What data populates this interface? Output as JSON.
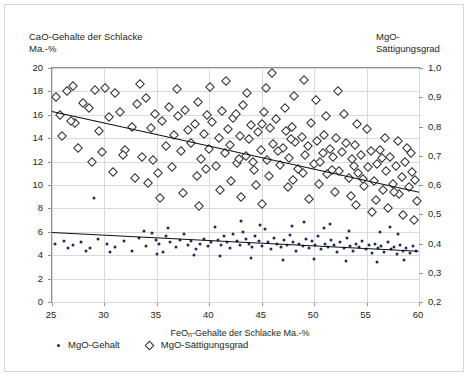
{
  "chart_data": {
    "type": "scatter",
    "title": "",
    "xlabel": "FeOn-Gehalte der Schlacke Ma.-%",
    "ylabel_left": "CaO-Gehalte der Schlacke\nMa.-%",
    "ylabel_right": "MgO-Sättigungsgrad",
    "xlim": [
      25,
      60
    ],
    "ylim_left": [
      0,
      20
    ],
    "ylim_right": [
      0.2,
      1.0
    ],
    "xticks": [
      "25",
      "30",
      "35",
      "40",
      "45",
      "50",
      "55",
      "60"
    ],
    "xtick_values": [
      25,
      30,
      35,
      40,
      45,
      50,
      55,
      60
    ],
    "yticks_left": [
      "0",
      "2",
      "4",
      "6",
      "8",
      "10",
      "12",
      "14",
      "16",
      "18",
      "20"
    ],
    "ytick_values_left": [
      0,
      2,
      4,
      6,
      8,
      10,
      12,
      14,
      16,
      18,
      20
    ],
    "yticks_right": [
      "0,2",
      "0,3",
      "0,4",
      "0,5",
      "0,6",
      "0,7",
      "0,8",
      "0,9",
      "1,0"
    ],
    "ytick_values_right": [
      0.2,
      0.3,
      0.4,
      0.5,
      0.6,
      0.7,
      0.8,
      0.9,
      1.0
    ],
    "grid": true,
    "legend_position": "below",
    "legend": [
      {
        "label": "MgO-Gehalt",
        "marker": "filled-circle",
        "color": "#1c2a60"
      },
      {
        "label": "MgO-Sättigungsgrad",
        "marker": "open-diamond",
        "color": "#2b2b2b"
      }
    ],
    "series": [
      {
        "name": "MgO-Gehalt",
        "marker": "filled-circle",
        "color": "#1c2a60",
        "axis": "left",
        "trendline": {
          "x0": 25,
          "y0": 5.95,
          "x1": 60,
          "y1": 4.35,
          "color": "#0f0f0f"
        },
        "points": [
          [
            25.3,
            5.0
          ],
          [
            26.1,
            5.2
          ],
          [
            27.0,
            4.9
          ],
          [
            27.8,
            5.1
          ],
          [
            28.6,
            4.6
          ],
          [
            29.0,
            8.9
          ],
          [
            29.4,
            5.4
          ],
          [
            30.2,
            5.0
          ],
          [
            31.0,
            4.7
          ],
          [
            31.9,
            5.2
          ],
          [
            32.6,
            4.4
          ],
          [
            33.3,
            5.5
          ],
          [
            34.0,
            4.8
          ],
          [
            34.5,
            5.9
          ],
          [
            34.9,
            5.3
          ],
          [
            35.2,
            5.0
          ],
          [
            35.6,
            4.3
          ],
          [
            35.9,
            5.6
          ],
          [
            36.3,
            5.1
          ],
          [
            36.8,
            4.7
          ],
          [
            37.2,
            5.3
          ],
          [
            37.6,
            5.8
          ],
          [
            38.0,
            4.9
          ],
          [
            38.3,
            5.2
          ],
          [
            38.7,
            4.5
          ],
          [
            39.1,
            5.0
          ],
          [
            39.5,
            5.4
          ],
          [
            39.9,
            4.8
          ],
          [
            40.2,
            5.1
          ],
          [
            40.5,
            6.4
          ],
          [
            40.8,
            5.3
          ],
          [
            41.1,
            4.9
          ],
          [
            41.4,
            5.6
          ],
          [
            41.7,
            5.1
          ],
          [
            42.0,
            4.6
          ],
          [
            42.3,
            5.8
          ],
          [
            42.6,
            5.2
          ],
          [
            42.9,
            4.9
          ],
          [
            43.2,
            6.0
          ],
          [
            43.5,
            5.4
          ],
          [
            43.8,
            5.0
          ],
          [
            44.1,
            4.7
          ],
          [
            44.4,
            5.6
          ],
          [
            44.7,
            5.2
          ],
          [
            45.0,
            4.8
          ],
          [
            45.3,
            6.2
          ],
          [
            45.6,
            5.1
          ],
          [
            45.9,
            4.5
          ],
          [
            46.2,
            5.5
          ],
          [
            46.5,
            5.0
          ],
          [
            46.8,
            4.7
          ],
          [
            47.1,
            5.3
          ],
          [
            47.4,
            4.9
          ],
          [
            47.7,
            5.7
          ],
          [
            48.0,
            5.1
          ],
          [
            48.3,
            4.4
          ],
          [
            48.6,
            5.0
          ],
          [
            48.9,
            4.8
          ],
          [
            49.2,
            5.4
          ],
          [
            49.5,
            4.6
          ],
          [
            49.8,
            5.2
          ],
          [
            50.1,
            4.9
          ],
          [
            50.4,
            5.6
          ],
          [
            50.7,
            4.5
          ],
          [
            51.0,
            5.0
          ],
          [
            51.3,
            4.7
          ],
          [
            51.6,
            5.3
          ],
          [
            51.9,
            4.9
          ],
          [
            52.2,
            4.3
          ],
          [
            52.5,
            5.1
          ],
          [
            52.8,
            4.6
          ],
          [
            53.1,
            5.5
          ],
          [
            53.4,
            4.8
          ],
          [
            53.7,
            4.4
          ],
          [
            54.0,
            5.0
          ],
          [
            54.3,
            4.7
          ],
          [
            54.6,
            5.2
          ],
          [
            54.9,
            4.5
          ],
          [
            55.2,
            4.9
          ],
          [
            55.5,
            4.2
          ],
          [
            55.8,
            5.0
          ],
          [
            56.1,
            4.6
          ],
          [
            56.4,
            4.8
          ],
          [
            56.7,
            4.3
          ],
          [
            57.0,
            5.1
          ],
          [
            57.3,
            4.5
          ],
          [
            57.6,
            4.7
          ],
          [
            57.9,
            4.1
          ],
          [
            58.2,
            4.9
          ],
          [
            58.5,
            4.4
          ],
          [
            58.8,
            4.6
          ],
          [
            59.1,
            4.2
          ],
          [
            59.4,
            4.8
          ],
          [
            59.7,
            4.4
          ],
          [
            33.8,
            6.1
          ],
          [
            36.1,
            6.3
          ],
          [
            43.0,
            6.9
          ],
          [
            44.8,
            6.6
          ],
          [
            47.9,
            6.5
          ],
          [
            50.9,
            6.3
          ],
          [
            53.3,
            6.1
          ],
          [
            56.3,
            6.0
          ],
          [
            58.0,
            5.8
          ],
          [
            41.0,
            3.9
          ],
          [
            44.0,
            3.8
          ],
          [
            47.0,
            3.6
          ],
          [
            50.0,
            3.7
          ],
          [
            53.0,
            3.5
          ],
          [
            56.0,
            3.4
          ],
          [
            58.6,
            3.6
          ],
          [
            35.0,
            4.1
          ],
          [
            38.5,
            4.0
          ],
          [
            30.5,
            4.3
          ],
          [
            28.2,
            4.4
          ],
          [
            26.5,
            4.6
          ],
          [
            49.0,
            6.8
          ],
          [
            51.5,
            6.7
          ],
          [
            57.2,
            6.4
          ]
        ]
      },
      {
        "name": "MgO-Sättigungsgrad",
        "marker": "open-diamond",
        "color": "#2b2b2b",
        "axis": "left",
        "trendline": {
          "x0": 25,
          "y0": 16.3,
          "x1": 60,
          "y1": 9.4,
          "color": "#0f0f0f"
        },
        "points": [
          [
            25.4,
            17.5
          ],
          [
            25.8,
            16.0
          ],
          [
            26.4,
            18.0
          ],
          [
            27.2,
            15.3
          ],
          [
            28.0,
            17.0
          ],
          [
            28.5,
            16.6
          ],
          [
            29.1,
            18.1
          ],
          [
            29.8,
            12.8
          ],
          [
            30.4,
            15.8
          ],
          [
            31.0,
            17.9
          ],
          [
            31.5,
            16.2
          ],
          [
            32.0,
            13.0
          ],
          [
            32.6,
            15.0
          ],
          [
            33.1,
            16.9
          ],
          [
            33.6,
            12.4
          ],
          [
            34.0,
            17.4
          ],
          [
            34.4,
            14.9
          ],
          [
            34.8,
            16.1
          ],
          [
            35.1,
            11.0
          ],
          [
            35.5,
            15.5
          ],
          [
            35.9,
            13.3
          ],
          [
            36.2,
            16.7
          ],
          [
            36.6,
            14.3
          ],
          [
            37.0,
            15.9
          ],
          [
            37.3,
            12.9
          ],
          [
            37.7,
            16.4
          ],
          [
            38.0,
            14.7
          ],
          [
            38.3,
            13.6
          ],
          [
            38.6,
            15.2
          ],
          [
            38.9,
            17.1
          ],
          [
            39.2,
            12.2
          ],
          [
            39.5,
            14.4
          ],
          [
            39.8,
            16.0
          ],
          [
            40.0,
            13.1
          ],
          [
            40.3,
            15.4
          ],
          [
            40.6,
            11.6
          ],
          [
            40.9,
            14.0
          ],
          [
            41.2,
            16.3
          ],
          [
            41.5,
            12.7
          ],
          [
            41.8,
            14.8
          ],
          [
            42.0,
            13.4
          ],
          [
            42.3,
            15.7
          ],
          [
            42.6,
            11.9
          ],
          [
            42.9,
            14.2
          ],
          [
            43.2,
            16.8
          ],
          [
            43.5,
            12.5
          ],
          [
            43.8,
            13.9
          ],
          [
            44.0,
            15.1
          ],
          [
            44.3,
            11.3
          ],
          [
            44.6,
            14.5
          ],
          [
            44.9,
            13.0
          ],
          [
            45.2,
            16.2
          ],
          [
            45.5,
            12.1
          ],
          [
            45.8,
            14.9
          ],
          [
            46.0,
            19.6
          ],
          [
            46.1,
            13.5
          ],
          [
            46.4,
            15.6
          ],
          [
            46.7,
            11.7
          ],
          [
            47.0,
            13.2
          ],
          [
            47.3,
            14.6
          ],
          [
            47.6,
            12.3
          ],
          [
            47.9,
            15.0
          ],
          [
            48.2,
            13.7
          ],
          [
            48.5,
            11.4
          ],
          [
            48.8,
            14.1
          ],
          [
            49.1,
            12.6
          ],
          [
            49.4,
            13.3
          ],
          [
            49.7,
            15.3
          ],
          [
            50.0,
            11.8
          ],
          [
            50.3,
            13.8
          ],
          [
            50.6,
            12.0
          ],
          [
            50.9,
            14.3
          ],
          [
            51.2,
            10.9
          ],
          [
            51.5,
            13.1
          ],
          [
            51.8,
            12.4
          ],
          [
            52.1,
            14.0
          ],
          [
            52.4,
            11.2
          ],
          [
            52.7,
            12.8
          ],
          [
            53.0,
            13.6
          ],
          [
            53.3,
            10.6
          ],
          [
            53.6,
            12.2
          ],
          [
            53.9,
            13.4
          ],
          [
            54.2,
            11.0
          ],
          [
            54.5,
            12.6
          ],
          [
            54.8,
            9.9
          ],
          [
            55.1,
            11.5
          ],
          [
            55.4,
            12.9
          ],
          [
            55.7,
            10.3
          ],
          [
            56.0,
            11.8
          ],
          [
            56.3,
            13.0
          ],
          [
            56.6,
            9.6
          ],
          [
            56.9,
            11.2
          ],
          [
            57.2,
            12.4
          ],
          [
            57.5,
            10.1
          ],
          [
            57.8,
            11.6
          ],
          [
            58.1,
            9.2
          ],
          [
            58.4,
            10.7
          ],
          [
            58.7,
            12.0
          ],
          [
            59.0,
            9.8
          ],
          [
            59.3,
            11.1
          ],
          [
            59.6,
            10.4
          ],
          [
            59.8,
            8.6
          ],
          [
            35.3,
            8.9
          ],
          [
            37.5,
            9.3
          ],
          [
            39.0,
            8.2
          ],
          [
            41.0,
            9.6
          ],
          [
            43.0,
            9.0
          ],
          [
            45.0,
            8.4
          ],
          [
            47.5,
            9.8
          ],
          [
            49.5,
            8.8
          ],
          [
            52.0,
            9.4
          ],
          [
            54.0,
            8.3
          ],
          [
            55.5,
            7.7
          ],
          [
            57.0,
            8.0
          ],
          [
            58.5,
            7.4
          ],
          [
            59.5,
            7.0
          ],
          [
            34.2,
            10.2
          ],
          [
            32.9,
            10.6
          ],
          [
            30.8,
            11.1
          ],
          [
            28.8,
            12.0
          ],
          [
            27.5,
            13.2
          ],
          [
            26.0,
            14.2
          ],
          [
            50.2,
            17.3
          ],
          [
            52.8,
            16.1
          ],
          [
            48.1,
            17.6
          ],
          [
            45.4,
            18.3
          ],
          [
            43.6,
            17.9
          ],
          [
            40.1,
            18.4
          ],
          [
            36.9,
            18.2
          ],
          [
            33.4,
            18.6
          ],
          [
            30.1,
            18.3
          ],
          [
            27.0,
            18.5
          ],
          [
            55.0,
            14.8
          ],
          [
            56.8,
            14.0
          ],
          [
            58.9,
            13.2
          ],
          [
            54.1,
            15.2
          ],
          [
            51.1,
            15.9
          ],
          [
            47.2,
            16.6
          ],
          [
            44.2,
            12.0
          ],
          [
            46.6,
            12.9
          ],
          [
            42.1,
            10.3
          ],
          [
            44.5,
            10.0
          ],
          [
            48.0,
            10.4
          ],
          [
            50.5,
            10.1
          ],
          [
            53.5,
            9.1
          ],
          [
            55.9,
            8.7
          ],
          [
            38.8,
            10.8
          ],
          [
            36.4,
            11.5
          ],
          [
            34.6,
            12.1
          ],
          [
            31.8,
            12.6
          ],
          [
            29.5,
            14.6
          ],
          [
            26.8,
            15.5
          ],
          [
            41.6,
            18.9
          ],
          [
            49.0,
            19.0
          ],
          [
            52.3,
            18.0
          ],
          [
            39.7,
            11.4
          ],
          [
            42.8,
            12.2
          ],
          [
            45.7,
            10.8
          ],
          [
            48.9,
            11.0
          ],
          [
            51.7,
            11.3
          ],
          [
            54.7,
            10.5
          ],
          [
            57.6,
            9.4
          ],
          [
            59.2,
            12.7
          ],
          [
            58.0,
            13.8
          ],
          [
            56.5,
            12.3
          ],
          [
            53.8,
            11.6
          ],
          [
            50.8,
            12.7
          ],
          [
            47.8,
            13.9
          ],
          [
            45.0,
            15.2
          ],
          [
            42.5,
            16.1
          ]
        ]
      }
    ]
  }
}
